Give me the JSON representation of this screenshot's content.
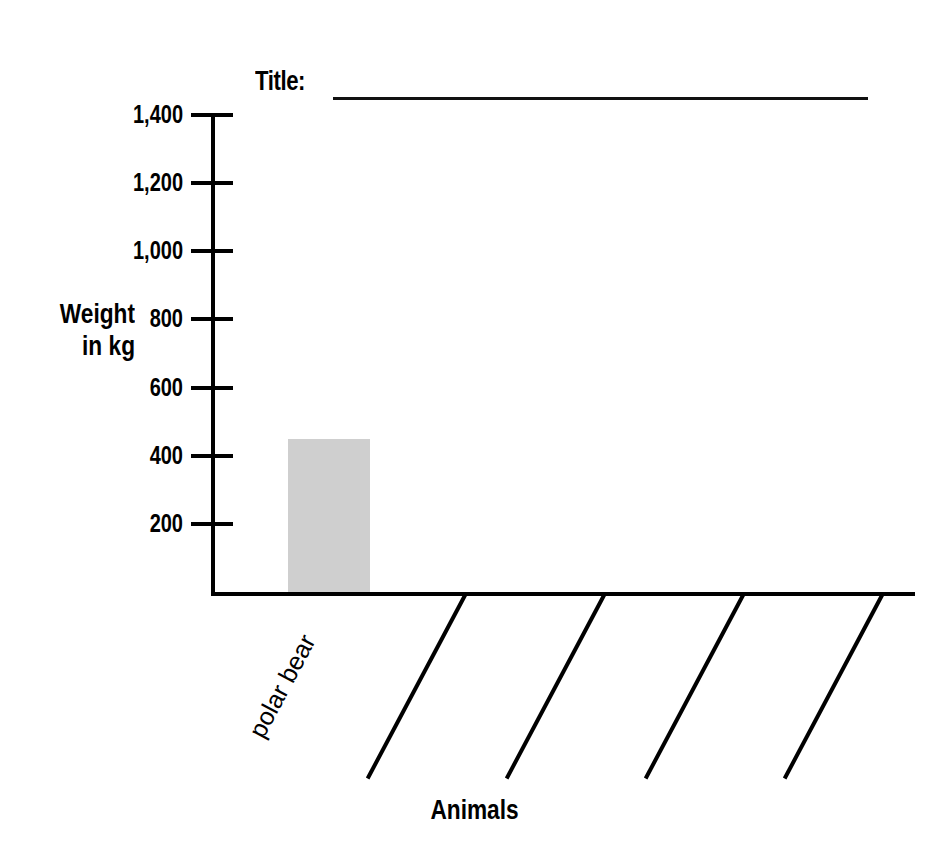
{
  "title": {
    "label": "Title:",
    "value": "",
    "blank_line": true
  },
  "axes": {
    "y_title_line1": "Weight",
    "y_title_line2": "in kg",
    "x_title": "Animals"
  },
  "chart_data": {
    "type": "bar",
    "title": "Title:",
    "xlabel": "Animals",
    "ylabel": "Weight in kg",
    "categories": [
      "polar bear",
      "",
      "",
      "",
      ""
    ],
    "values": [
      450,
      null,
      null,
      null,
      null
    ],
    "ylim": [
      0,
      1400
    ],
    "ytick_labels": [
      "200",
      "400",
      "600",
      "800",
      "1,000",
      "1,200",
      "1,400"
    ],
    "ytick_values": [
      200,
      400,
      600,
      800,
      1000,
      1200,
      1400
    ],
    "grid": false,
    "legend": false,
    "bar_color": "#cfcfcf",
    "axis_color": "#000000",
    "blank_categories": 4,
    "note": "Worksheet bar graph with one completed bar (polar bear, about 450 kg) and four blank diagonal write-in lines."
  },
  "colors": {
    "bar_fill": "#cfcfcf",
    "axis": "#000000",
    "background": "#ffffff",
    "text": "#000000"
  }
}
